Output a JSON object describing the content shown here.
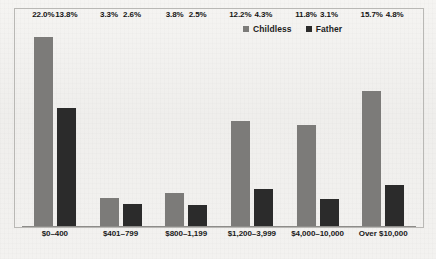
{
  "chart_data": {
    "type": "bar",
    "title": "",
    "xlabel": "",
    "ylabel": "",
    "grid": false,
    "legend_position": "top-right",
    "ylim": [
      0,
      24
    ],
    "categories": [
      "$0–400",
      "$401–799",
      "$800–1,199",
      "$1,200–3,999",
      "$4,000–10,000",
      "Over $10,000"
    ],
    "series": [
      {
        "name": "Childless",
        "color": "#7c7b79",
        "values": [
          22.0,
          3.3,
          3.8,
          12.2,
          11.8,
          15.7
        ],
        "labels": [
          "22.0%",
          "3.3%",
          "3.8%",
          "12.2%",
          "11.8%",
          "15.7%"
        ]
      },
      {
        "name": "Father",
        "color": "#2b2b2b",
        "values": [
          13.8,
          2.6,
          2.5,
          4.3,
          3.1,
          4.8
        ],
        "labels": [
          "13.8%",
          "2.6%",
          "2.5%",
          "4.3%",
          "3.1%",
          "4.8%"
        ]
      }
    ]
  },
  "legend": {
    "items": [
      {
        "label": "Childless",
        "color": "#7c7b79",
        "swatch": "square-swatch-icon"
      },
      {
        "label": "Father",
        "color": "#2b2b2b",
        "swatch": "square-swatch-icon"
      }
    ]
  },
  "caption": {
    "text": " "
  }
}
